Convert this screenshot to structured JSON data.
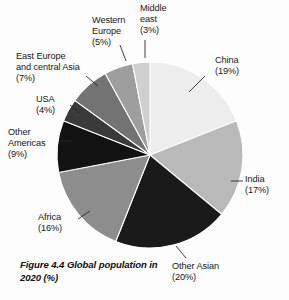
{
  "figure": {
    "caption": "Figure 4.4 Global population in 2020 (%)",
    "background_color": "#fdfdfd",
    "text_color": "#171717"
  },
  "chart_data": {
    "type": "pie",
    "title": "Figure 4.4 Global population in 2020 (%)",
    "xlabel": "",
    "ylabel": "",
    "units": "percent",
    "start_angle_deg": 0,
    "direction": "clockwise",
    "legend": "none",
    "grid": false,
    "categories": [
      "China",
      "India",
      "Other Asian",
      "Africa",
      "Other Americas",
      "USA",
      "East Europe and central Asia",
      "Western Europe",
      "Middle east"
    ],
    "values": [
      19,
      17,
      20,
      16,
      9,
      4,
      7,
      5,
      3
    ],
    "colors": [
      "#ededed",
      "#b9b9b9",
      "#1a1a1a",
      "#8d8d8d",
      "#121212",
      "#3a3a3a",
      "#737373",
      "#9e9e9e",
      "#cfcfcf"
    ],
    "slices": [
      {
        "label": "China",
        "value": 19,
        "value_text": "(19%)",
        "color": "#ededed"
      },
      {
        "label": "India",
        "value": 17,
        "value_text": "(17%)",
        "color": "#b9b9b9"
      },
      {
        "label": "Other Asian",
        "value": 20,
        "value_text": "(20%)",
        "color": "#1a1a1a"
      },
      {
        "label": "Africa",
        "value": 16,
        "value_text": "(16%)",
        "color": "#8d8d8d"
      },
      {
        "label": "Other Americas",
        "value": 9,
        "value_text": "(9%)",
        "color": "#121212"
      },
      {
        "label": "USA",
        "value": 4,
        "value_text": "(4%)",
        "color": "#3a3a3a"
      },
      {
        "label": "East Europe and central Asia",
        "value": 7,
        "value_text": "(7%)",
        "color": "#737373"
      },
      {
        "label": "Western Europe",
        "value": 5,
        "value_text": "(5%)",
        "color": "#9e9e9e"
      },
      {
        "label": "Middle east",
        "value": 3,
        "value_text": "(3%)",
        "color": "#cfcfcf"
      }
    ],
    "geometry": {
      "cx": 150,
      "cy": 155,
      "r": 93
    }
  },
  "labels": {
    "china": "China\n(19%)",
    "india": "India\n(17%)",
    "other_asian": "Other Asian\n(20%)",
    "africa": "Africa\n(16%)",
    "other_americas": "Other\nAmericas\n(9%)",
    "usa": "USA\n(4%)",
    "east_europe": "East Europe\nand central Asia\n(7%)",
    "western_europe": "Western\nEurope\n(5%)",
    "middle_east": "Middle\neast\n(3%)"
  }
}
